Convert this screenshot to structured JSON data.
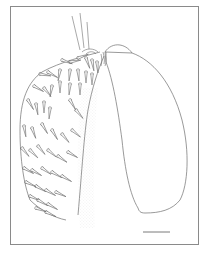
{
  "figure": {
    "description": "Line drawing of a setose appendage lobe with a smooth adjacent lobe and scale bar",
    "colors": {
      "line": "#6e6e6e",
      "frame": "#8a8a8a",
      "stipple": "#cfcfcf",
      "background": "#ffffff"
    },
    "scale_bar": {
      "x1": 143,
      "x2": 170,
      "y": 232,
      "label": ""
    },
    "frame": {
      "left": 10,
      "top": 6,
      "right": 199,
      "bottom": 245
    }
  }
}
